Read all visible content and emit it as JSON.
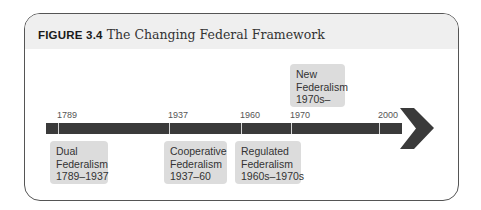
{
  "figure": {
    "label": "FIGURE 3.4",
    "title": "The Changing Federal Framework"
  },
  "timeline": {
    "ticks": [
      {
        "year": "1789"
      },
      {
        "year": "1937"
      },
      {
        "year": "1960"
      },
      {
        "year": "1970"
      },
      {
        "year": "2000"
      }
    ],
    "eras": [
      {
        "line1": "Dual",
        "line2": "Federalism",
        "line3": "1789–1937",
        "position": "below"
      },
      {
        "line1": "Cooperative",
        "line2": "Federalism",
        "line3": "1937–60",
        "position": "below"
      },
      {
        "line1": "Regulated",
        "line2": "Federalism",
        "line3": "1960s–1970s",
        "position": "below"
      },
      {
        "line1": "New",
        "line2": "Federalism",
        "line3": "1970s–",
        "position": "above"
      }
    ],
    "colors": {
      "bar": "#3a3a3a",
      "box": "#dcdcdc",
      "header": "#efefef"
    }
  }
}
